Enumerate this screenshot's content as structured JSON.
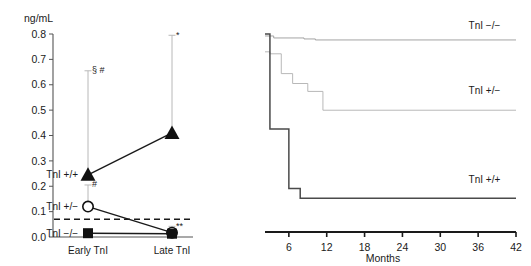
{
  "chart_data": [
    {
      "id": "troponin-levels",
      "type": "line",
      "title": "",
      "unit_label": "ng/mL",
      "xlabel": "",
      "ylabel": "ng/mL",
      "categories": [
        "Early TnI",
        "Late TnI"
      ],
      "ylim": [
        0.0,
        0.8
      ],
      "ytick_labels": [
        "0.0",
        "0.1",
        "0.2",
        "0.3",
        "0.4",
        "0.5",
        "0.6",
        "0.7",
        "0.8"
      ],
      "ytick_values": [
        0.0,
        0.1,
        0.2,
        0.3,
        0.4,
        0.5,
        0.6,
        0.7,
        0.8
      ],
      "grid": false,
      "legend_position": "inline-left",
      "threshold": {
        "value": 0.07,
        "style": "dashed"
      },
      "series": [
        {
          "name": "TnI +/+",
          "marker": "filled-triangle",
          "label_at": "Early TnI",
          "values": [
            0.245,
            0.41
          ],
          "error_upper": [
            0.655,
            0.795
          ],
          "annotations": [
            "§ #",
            "*"
          ]
        },
        {
          "name": "TnI +/−",
          "marker": "open-circle",
          "label_at": "Early TnI",
          "values": [
            0.12,
            0.017
          ],
          "error_upper": [
            0.205,
            0.042
          ],
          "annotations": [
            "#",
            "**"
          ]
        },
        {
          "name": "TnI −/−",
          "marker": "filled-square",
          "label_at": "Early TnI",
          "values": [
            0.015,
            0.013
          ],
          "error_upper": [
            0.015,
            0.013
          ],
          "annotations": [
            "",
            ""
          ]
        }
      ]
    },
    {
      "id": "cardiac-event-free-survival",
      "type": "line",
      "title": "",
      "xlabel": "Months",
      "ylabel": "Cardiac event free rate (%)",
      "xlim": [
        0,
        42
      ],
      "ylim": [
        0,
        100
      ],
      "xtick_labels": [
        "0",
        "6",
        "12",
        "18",
        "24",
        "30",
        "36",
        "42"
      ],
      "xtick_values": [
        0,
        6,
        12,
        18,
        24,
        30,
        36,
        42
      ],
      "ytick_labels": [
        "0",
        "20",
        "40",
        "60",
        "80",
        "100"
      ],
      "ytick_values": [
        0,
        20,
        40,
        60,
        80,
        100
      ],
      "grid": false,
      "legend_position": "right-inline",
      "series": [
        {
          "name": "TnI −/−",
          "label_x": 37,
          "label_y": 99,
          "steps": [
            [
              0,
              100
            ],
            [
              1.8,
              100
            ],
            [
              1.8,
              99
            ],
            [
              3.6,
              99
            ],
            [
              3.6,
              98
            ],
            [
              8.4,
              98
            ],
            [
              8.4,
              97.5
            ],
            [
              10.2,
              97.5
            ],
            [
              10.2,
              97
            ],
            [
              42,
              97
            ]
          ]
        },
        {
          "name": "TnI +/−",
          "label_x": 37,
          "label_y": 66,
          "steps": [
            [
              0,
              100
            ],
            [
              1.2,
              100
            ],
            [
              1.2,
              91
            ],
            [
              3.0,
              91
            ],
            [
              3.0,
              90
            ],
            [
              4.8,
              90
            ],
            [
              4.8,
              80
            ],
            [
              6.6,
              80
            ],
            [
              6.6,
              75
            ],
            [
              9.0,
              75
            ],
            [
              9.0,
              71
            ],
            [
              11.4,
              71
            ],
            [
              11.4,
              61.5
            ],
            [
              42,
              61.5
            ]
          ]
        },
        {
          "name": "TnI +/+",
          "label_x": 37,
          "label_y": 21,
          "steps": [
            [
              0,
              100
            ],
            [
              3.0,
              100
            ],
            [
              3.0,
              52
            ],
            [
              6.0,
              52
            ],
            [
              6.0,
              22
            ],
            [
              7.8,
              22
            ],
            [
              7.8,
              17
            ],
            [
              42,
              17
            ]
          ]
        }
      ]
    }
  ]
}
